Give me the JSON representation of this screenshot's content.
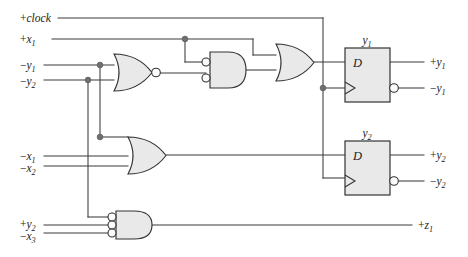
{
  "diagram": {
    "colors": {
      "wire": "#3a3a3a",
      "gate_fill": "#e9e9e9",
      "gate_outline": "#333333",
      "junction": "#6f6f6f",
      "background": "#ffffff"
    }
  },
  "inputs": [
    {
      "id": "clock",
      "sign": "+",
      "name": "clock",
      "sub": ""
    },
    {
      "id": "x1",
      "sign": "+",
      "name": "x",
      "sub": "1"
    },
    {
      "id": "ny1",
      "sign": "−",
      "name": "y",
      "sub": "1"
    },
    {
      "id": "ny2",
      "sign": "−",
      "name": "y",
      "sub": "2"
    },
    {
      "id": "nx1",
      "sign": "−",
      "name": "x",
      "sub": "1"
    },
    {
      "id": "nx2",
      "sign": "−",
      "name": "x",
      "sub": "2"
    },
    {
      "id": "py2",
      "sign": "+",
      "name": "y",
      "sub": "2"
    },
    {
      "id": "nx3",
      "sign": "−",
      "name": "x",
      "sub": "3"
    }
  ],
  "outputs": [
    {
      "id": "out_py1",
      "sign": "+",
      "name": "y",
      "sub": "1"
    },
    {
      "id": "out_ny1",
      "sign": "−",
      "name": "y",
      "sub": "1"
    },
    {
      "id": "out_py2",
      "sign": "+",
      "name": "y",
      "sub": "2"
    },
    {
      "id": "out_ny2",
      "sign": "−",
      "name": "y",
      "sub": "2"
    },
    {
      "id": "out_pz1",
      "sign": "+",
      "name": "z",
      "sub": "1"
    }
  ],
  "flipflops": [
    {
      "id": "ff_y1",
      "label": "y",
      "sub": "1",
      "input_label": "D",
      "clock_symbol": "triangle",
      "q_label": "+y1",
      "qbar_label": "-y1"
    },
    {
      "id": "ff_y2",
      "label": "y",
      "sub": "2",
      "input_label": "D",
      "clock_symbol": "triangle",
      "q_label": "+y2",
      "qbar_label": "-y2"
    }
  ],
  "gates": [
    {
      "id": "nor_y1y2",
      "type": "NOR",
      "inputs": 2,
      "inverted_inputs": 0,
      "inverted_output": true
    },
    {
      "id": "and_mid",
      "type": "AND",
      "inputs": 2,
      "inverted_inputs": 2,
      "inverted_output": false
    },
    {
      "id": "or_top",
      "type": "OR",
      "inputs": 2,
      "inverted_inputs": 0,
      "inverted_output": false
    },
    {
      "id": "or_mid",
      "type": "OR",
      "inputs": 3,
      "inverted_inputs": 0,
      "inverted_output": false
    },
    {
      "id": "and_bot",
      "type": "AND",
      "inputs": 3,
      "inverted_inputs": 3,
      "inverted_output": false
    }
  ]
}
